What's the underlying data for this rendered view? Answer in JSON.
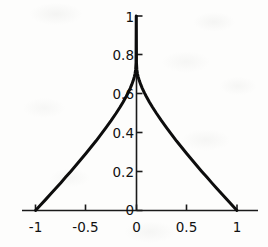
{
  "chart_data": {
    "type": "line",
    "title": "",
    "xlabel": "",
    "ylabel": "",
    "xlim": [
      -1.08,
      1.08
    ],
    "ylim": [
      0,
      1.06
    ],
    "grid": false,
    "legend": null,
    "axes_style": "centered-spines",
    "xticks": [
      -1,
      -0.5,
      0,
      0.5,
      1
    ],
    "xtick_labels": [
      "-1",
      "-0.5",
      "0",
      "0.5",
      "1"
    ],
    "yticks": [
      0,
      0.2,
      0.4,
      0.6,
      0.8,
      1
    ],
    "ytick_labels": [
      "0",
      "0.2",
      "0.4",
      "0.6",
      "0.8",
      "1"
    ],
    "series": [
      {
        "name": "curve",
        "color": "#0d0d0d",
        "linewidth": 3,
        "x": [
          -1.0,
          -0.95,
          -0.9,
          -0.85,
          -0.8,
          -0.75,
          -0.7,
          -0.65,
          -0.6,
          -0.55,
          -0.5,
          -0.45,
          -0.4,
          -0.35,
          -0.3,
          -0.25,
          -0.2,
          -0.16,
          -0.13,
          -0.1,
          -0.08,
          -0.06,
          -0.045,
          -0.03,
          -0.02,
          -0.012,
          -0.006,
          -0.002,
          0.0,
          0.002,
          0.006,
          0.012,
          0.02,
          0.03,
          0.045,
          0.06,
          0.08,
          0.1,
          0.13,
          0.16,
          0.2,
          0.25,
          0.3,
          0.35,
          0.4,
          0.45,
          0.5,
          0.55,
          0.6,
          0.65,
          0.7,
          0.75,
          0.8,
          0.85,
          0.9,
          0.95,
          1.0
        ],
        "y": [
          0.0,
          0.028,
          0.056,
          0.085,
          0.113,
          0.142,
          0.172,
          0.201,
          0.231,
          0.262,
          0.293,
          0.325,
          0.357,
          0.391,
          0.426,
          0.462,
          0.5,
          0.532,
          0.558,
          0.586,
          0.606,
          0.628,
          0.647,
          0.668,
          0.686,
          0.703,
          0.724,
          0.76,
          1.0,
          0.76,
          0.724,
          0.703,
          0.686,
          0.668,
          0.647,
          0.628,
          0.606,
          0.586,
          0.558,
          0.532,
          0.5,
          0.462,
          0.426,
          0.391,
          0.357,
          0.325,
          0.293,
          0.262,
          0.231,
          0.201,
          0.172,
          0.142,
          0.113,
          0.085,
          0.056,
          0.028,
          0.0
        ]
      }
    ],
    "annotations": []
  },
  "axis_colors": {
    "spine": "#1a1a1a",
    "tick_label": "#111111",
    "background": "#fdfdfc"
  }
}
